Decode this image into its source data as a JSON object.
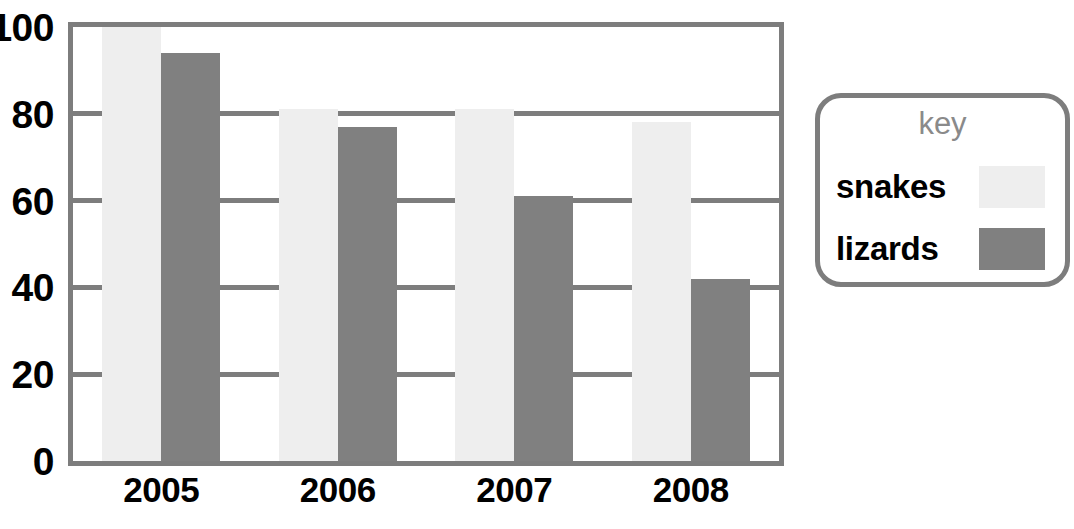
{
  "chart_data": {
    "type": "bar",
    "title": "",
    "xlabel": "",
    "ylabel": "",
    "categories": [
      "2005",
      "2006",
      "2007",
      "2008"
    ],
    "series": [
      {
        "name": "snakes",
        "color": "#eeeeee",
        "values": [
          100,
          81,
          81,
          78
        ]
      },
      {
        "name": "lizards",
        "color": "#808080",
        "values": [
          94,
          77,
          61,
          42
        ]
      }
    ],
    "ylim": [
      0,
      100
    ],
    "yticks": [
      0,
      20,
      40,
      60,
      80,
      100
    ],
    "ytick_labels": [
      "0",
      "20",
      "40",
      "60",
      "80",
      "100"
    ],
    "grid": true,
    "legend_position": "right"
  },
  "legend": {
    "title": "key",
    "entries": [
      {
        "label": "snakes",
        "swatch": "snakes"
      },
      {
        "label": "lizards",
        "swatch": "lizards"
      }
    ]
  },
  "colors": {
    "axis": "#7d7d7d",
    "grid": "#7d7d7d",
    "snakes": "#eeeeee",
    "lizards": "#808080",
    "text": "#000000",
    "legend_title_text": "#8a8a8a",
    "background": "#ffffff"
  }
}
